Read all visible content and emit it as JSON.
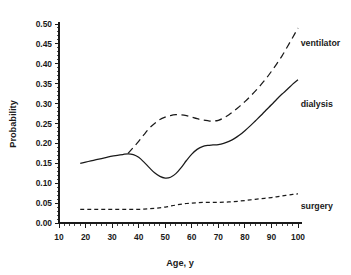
{
  "chart_data": {
    "type": "line",
    "title": "",
    "xlabel": "Age, y",
    "ylabel": "Probability",
    "xlim": [
      10,
      100
    ],
    "ylim": [
      0.0,
      0.5
    ],
    "grid": false,
    "legend_position": "right-inline",
    "xticks": [
      10,
      20,
      30,
      40,
      50,
      60,
      70,
      80,
      90,
      100
    ],
    "xtick_labels": [
      "10",
      "20",
      "30",
      "40",
      "50",
      "60",
      "70",
      "80",
      "90",
      "100"
    ],
    "x_minor_tick_step": 2,
    "yticks": [
      0.0,
      0.05,
      0.1,
      0.15,
      0.2,
      0.25,
      0.3,
      0.35,
      0.4,
      0.45,
      0.5
    ],
    "ytick_labels": [
      "0.00",
      "0.05",
      "0.10",
      "0.15",
      "0.20",
      "0.25",
      "0.30",
      "0.35",
      "0.40",
      "0.45",
      "0.50"
    ],
    "y_minor_tick_step": 0.01,
    "series": [
      {
        "name": "ventilator",
        "label": "ventilator",
        "style": "long-dash",
        "color": "#1a1a1a",
        "label_x": 101,
        "label_y": 0.452,
        "x": [
          36,
          38,
          40,
          42,
          44,
          46,
          48,
          50,
          52,
          54,
          56,
          58,
          60,
          62,
          64,
          66,
          68,
          70,
          72,
          74,
          76,
          78,
          80,
          82,
          84,
          86,
          88,
          90,
          92,
          94,
          96,
          98,
          100
        ],
        "y": [
          0.175,
          0.19,
          0.205,
          0.222,
          0.238,
          0.25,
          0.26,
          0.266,
          0.27,
          0.272,
          0.272,
          0.27,
          0.266,
          0.262,
          0.259,
          0.257,
          0.256,
          0.258,
          0.264,
          0.272,
          0.282,
          0.293,
          0.305,
          0.318,
          0.332,
          0.347,
          0.363,
          0.381,
          0.4,
          0.42,
          0.443,
          0.466,
          0.49
        ]
      },
      {
        "name": "dialysis",
        "label": "dialysis",
        "style": "solid",
        "color": "#1a1a1a",
        "label_x": 101,
        "label_y": 0.298,
        "x": [
          18,
          20,
          22,
          24,
          26,
          28,
          30,
          32,
          34,
          36,
          38,
          40,
          42,
          44,
          46,
          48,
          50,
          52,
          54,
          56,
          58,
          60,
          62,
          64,
          66,
          68,
          70,
          72,
          74,
          76,
          78,
          80,
          82,
          84,
          86,
          88,
          90,
          92,
          94,
          96,
          98,
          100
        ],
        "y": [
          0.15,
          0.153,
          0.156,
          0.159,
          0.162,
          0.165,
          0.168,
          0.17,
          0.172,
          0.174,
          0.172,
          0.165,
          0.153,
          0.139,
          0.126,
          0.117,
          0.113,
          0.115,
          0.124,
          0.139,
          0.157,
          0.173,
          0.185,
          0.192,
          0.195,
          0.196,
          0.197,
          0.2,
          0.205,
          0.212,
          0.221,
          0.232,
          0.244,
          0.257,
          0.27,
          0.284,
          0.297,
          0.311,
          0.324,
          0.336,
          0.349,
          0.36
        ]
      },
      {
        "name": "surgery",
        "label": "surgery",
        "style": "short-dash",
        "color": "#1a1a1a",
        "label_x": 101,
        "label_y": 0.042,
        "x": [
          18,
          22,
          26,
          30,
          34,
          38,
          42,
          46,
          50,
          54,
          58,
          62,
          66,
          70,
          74,
          78,
          82,
          86,
          90,
          94,
          98,
          100
        ],
        "y": [
          0.034,
          0.034,
          0.034,
          0.034,
          0.034,
          0.034,
          0.035,
          0.037,
          0.04,
          0.045,
          0.049,
          0.051,
          0.052,
          0.052,
          0.053,
          0.055,
          0.058,
          0.061,
          0.064,
          0.068,
          0.072,
          0.073
        ]
      }
    ]
  },
  "axes": {
    "ylabel": "Probability",
    "xlabel": "Age, y"
  }
}
